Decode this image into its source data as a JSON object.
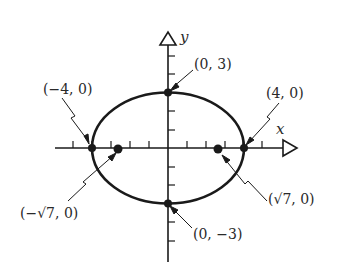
{
  "diagram": {
    "type": "ellipse",
    "equation_implied": "x^2/16 + y^2/9 = 1",
    "axes": {
      "x_label": "x",
      "y_label": "y"
    },
    "points": [
      {
        "id": "vertex-left",
        "label": "(−4, 0)",
        "x": -4,
        "y": 0
      },
      {
        "id": "vertex-right",
        "label": "(4, 0)",
        "x": 4,
        "y": 0
      },
      {
        "id": "covertex-top",
        "label": "(0, 3)",
        "x": 0,
        "y": 3
      },
      {
        "id": "covertex-bottom",
        "label": "(0, −3)",
        "x": 0,
        "y": -3
      },
      {
        "id": "focus-left",
        "label": "(−√7, 0)",
        "x": -2.6458,
        "y": 0
      },
      {
        "id": "focus-right",
        "label": "(√7, 0)",
        "x": 2.6458,
        "y": 0
      }
    ],
    "colors": {
      "ink": "#1a1a1a",
      "background": "#ffffff"
    }
  }
}
